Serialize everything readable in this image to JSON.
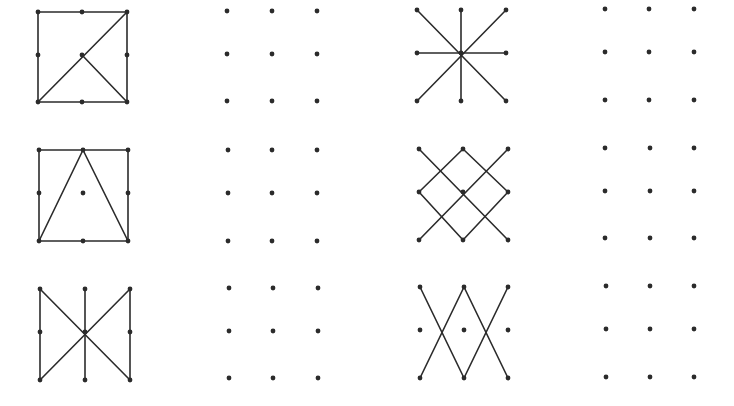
{
  "page": {
    "width": 734,
    "height": 406,
    "background": "#ffffff",
    "ink_color": "#2b2b2b"
  },
  "figures": [
    {
      "id": "A",
      "label": "square-with-diagonal-and-half-diagonal",
      "kind": "pattern",
      "xs": [
        38,
        82,
        127
      ],
      "ys": [
        12,
        55,
        102
      ],
      "edges": [
        [
          [
            0,
            0
          ],
          [
            2,
            0
          ]
        ],
        [
          [
            2,
            0
          ],
          [
            2,
            2
          ]
        ],
        [
          [
            2,
            2
          ],
          [
            0,
            2
          ]
        ],
        [
          [
            0,
            2
          ],
          [
            0,
            0
          ]
        ],
        [
          [
            0,
            2
          ],
          [
            2,
            0
          ]
        ],
        [
          [
            1,
            1
          ],
          [
            2,
            2
          ]
        ]
      ]
    },
    {
      "id": "D",
      "label": "empty-dot-grid",
      "kind": "blank",
      "xs": [
        227,
        272,
        317
      ],
      "ys": [
        11,
        54,
        101
      ],
      "edges": []
    },
    {
      "id": "G",
      "label": "star-eight-spokes",
      "kind": "pattern",
      "xs": [
        417,
        461,
        506
      ],
      "ys": [
        10,
        53,
        101
      ],
      "edges": [
        [
          [
            0,
            0
          ],
          [
            2,
            2
          ]
        ],
        [
          [
            2,
            0
          ],
          [
            0,
            2
          ]
        ],
        [
          [
            1,
            0
          ],
          [
            1,
            2
          ]
        ],
        [
          [
            0,
            1
          ],
          [
            2,
            1
          ]
        ]
      ]
    },
    {
      "id": "J",
      "label": "empty-dot-grid",
      "kind": "blank",
      "xs": [
        605,
        649,
        694
      ],
      "ys": [
        9,
        52,
        100
      ],
      "edges": []
    },
    {
      "id": "B",
      "label": "square-with-inscribed-triangle",
      "kind": "pattern",
      "xs": [
        39,
        83,
        128
      ],
      "ys": [
        150,
        193,
        241
      ],
      "edges": [
        [
          [
            0,
            0
          ],
          [
            2,
            0
          ]
        ],
        [
          [
            2,
            0
          ],
          [
            2,
            2
          ]
        ],
        [
          [
            2,
            2
          ],
          [
            0,
            2
          ]
        ],
        [
          [
            0,
            2
          ],
          [
            0,
            0
          ]
        ],
        [
          [
            0,
            2
          ],
          [
            1,
            0
          ]
        ],
        [
          [
            1,
            0
          ],
          [
            2,
            2
          ]
        ]
      ]
    },
    {
      "id": "E",
      "label": "empty-dot-grid",
      "kind": "blank",
      "xs": [
        228,
        272,
        317
      ],
      "ys": [
        150,
        193,
        241
      ],
      "edges": []
    },
    {
      "id": "H",
      "label": "diamond-with-crossing-diagonals",
      "kind": "pattern",
      "xs": [
        419,
        463,
        508
      ],
      "ys": [
        149,
        192,
        240
      ],
      "edges": [
        [
          [
            0,
            0
          ],
          [
            2,
            2
          ]
        ],
        [
          [
            2,
            0
          ],
          [
            0,
            2
          ]
        ],
        [
          [
            1,
            0
          ],
          [
            0,
            1
          ]
        ],
        [
          [
            0,
            1
          ],
          [
            1,
            2
          ]
        ],
        [
          [
            1,
            2
          ],
          [
            2,
            1
          ]
        ],
        [
          [
            2,
            1
          ],
          [
            1,
            0
          ]
        ]
      ]
    },
    {
      "id": "K",
      "label": "empty-dot-grid",
      "kind": "blank",
      "xs": [
        605,
        650,
        694
      ],
      "ys": [
        148,
        191,
        238
      ],
      "edges": []
    },
    {
      "id": "C",
      "label": "bowtie-with-verticals",
      "kind": "pattern",
      "xs": [
        40,
        85,
        130
      ],
      "ys": [
        289,
        332,
        380
      ],
      "edges": [
        [
          [
            0,
            0
          ],
          [
            0,
            2
          ]
        ],
        [
          [
            1,
            0
          ],
          [
            1,
            2
          ]
        ],
        [
          [
            2,
            0
          ],
          [
            2,
            2
          ]
        ],
        [
          [
            0,
            0
          ],
          [
            2,
            2
          ]
        ],
        [
          [
            2,
            0
          ],
          [
            0,
            2
          ]
        ]
      ]
    },
    {
      "id": "F",
      "label": "empty-dot-grid",
      "kind": "blank",
      "xs": [
        229,
        273,
        318
      ],
      "ys": [
        288,
        331,
        378
      ],
      "edges": []
    },
    {
      "id": "I",
      "label": "double-v-crossing",
      "kind": "pattern",
      "xs": [
        420,
        464,
        508
      ],
      "ys": [
        287,
        330,
        378
      ],
      "edges": [
        [
          [
            0,
            0
          ],
          [
            1,
            2
          ]
        ],
        [
          [
            1,
            2
          ],
          [
            2,
            0
          ]
        ],
        [
          [
            1,
            0
          ],
          [
            0,
            2
          ]
        ],
        [
          [
            1,
            0
          ],
          [
            2,
            2
          ]
        ]
      ]
    },
    {
      "id": "L",
      "label": "empty-dot-grid",
      "kind": "blank",
      "xs": [
        606,
        650,
        694
      ],
      "ys": [
        286,
        329,
        377
      ],
      "edges": []
    }
  ]
}
